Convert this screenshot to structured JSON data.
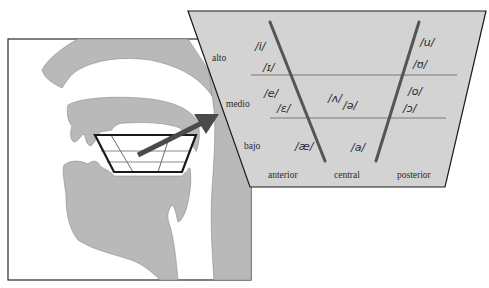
{
  "figure": {
    "title": "",
    "colors": {
      "anatomy_fill": "#b9b9b9",
      "panel_fill": "#d3d3d3",
      "line_dark": "#1a1a1a",
      "divider_line": "#7a7a7a",
      "vowel_line": "#555555",
      "arrow": "#4a4a4a",
      "background": "#ffffff"
    },
    "height_labels": [
      "alto",
      "medio",
      "bajo"
    ],
    "backness_labels": [
      "anterior",
      "central",
      "posterior"
    ],
    "vowels": {
      "high_front": [
        "/i/",
        "/ɪ/"
      ],
      "mid_front": [
        "/e/",
        "/ɛ/"
      ],
      "low_front": [
        "/æ/"
      ],
      "mid_central": [
        "/ʌ/",
        "/ə/"
      ],
      "low_central": [
        "/a/"
      ],
      "high_back": [
        "/u/",
        "/ʊ/"
      ],
      "mid_back": [
        "/o/",
        "/ɔ/"
      ]
    },
    "callout": {
      "description": "sagittal section of the vocal tract with vowel trapezoid in the mouth; arrow points to enlarged vowel chart"
    }
  }
}
